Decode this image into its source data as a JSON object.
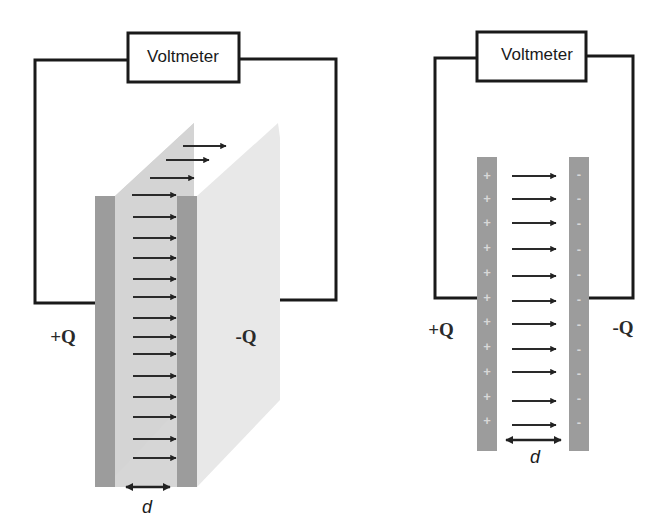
{
  "left_diagram": {
    "voltmeter_label": "Voltmeter",
    "positive_label": "+Q",
    "negative_label": "-Q",
    "separation_label": "d",
    "field_arrow_count": 18
  },
  "right_diagram": {
    "voltmeter_label": "Voltmeter",
    "positive_label": "+Q",
    "negative_label": "-Q",
    "separation_label": "d",
    "field_arrow_count": 12,
    "plate_signs": {
      "positive": [
        "+",
        "+",
        "+",
        "+",
        "+",
        "+",
        "+",
        "+",
        "+",
        "+",
        "+",
        "+"
      ],
      "negative": [
        "-",
        "-",
        "-",
        "-",
        "-",
        "-",
        "-",
        "-",
        "-",
        "-",
        "-",
        "-"
      ]
    }
  },
  "colors": {
    "wire": "#1a1a1a",
    "plate": "#9a9a9a",
    "plate_face": "#d2d2d2",
    "slab_back": "#e6e6e6",
    "arrow": "#2a2a2a"
  }
}
